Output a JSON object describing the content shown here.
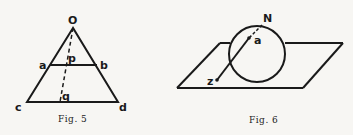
{
  "figures": [
    {
      "id": "fig5",
      "caption": "Fig. 5",
      "labels": {
        "O": "O",
        "a": "a",
        "b": "b",
        "p": "p",
        "q": "q",
        "c": "c",
        "d": "d"
      },
      "description": "Triangle Ocd with segment ab parallel to base cd; dashed line from O through p to q"
    },
    {
      "id": "fig6",
      "caption": "Fig. 6",
      "labels": {
        "N": "N",
        "a": "a",
        "z": "z"
      },
      "description": "Sphere resting on a plane; line from N through a to z"
    }
  ],
  "colors": {
    "ink": "#1a1a1a",
    "paper": "#f7f6f3"
  }
}
